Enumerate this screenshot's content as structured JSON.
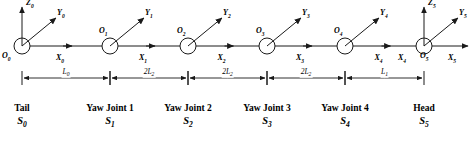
{
  "figure": {
    "line_color": "#1a1a1a",
    "background": "#ffffff"
  },
  "frames": [
    {
      "origin_label": "O",
      "origin_sub": "0",
      "x_label": "X",
      "x_sub": "0",
      "y_label": "Y",
      "y_sub": "0",
      "z_label": "Z",
      "z_sub": "0",
      "has_z": true,
      "cx": 22,
      "cy": 46,
      "caption_name": "Tail",
      "caption_sym": "S",
      "caption_sub": "0",
      "caption_cx": 22
    },
    {
      "origin_label": "O",
      "origin_sub": "1",
      "x_label": "X",
      "x_sub": "1",
      "y_label": "Y",
      "y_sub": "1",
      "z_label": "",
      "z_sub": "",
      "has_z": false,
      "cx": 110,
      "cy": 46,
      "caption_name": "Yaw Joint 1",
      "caption_sym": "S",
      "caption_sub": "1",
      "caption_cx": 110
    },
    {
      "origin_label": "O",
      "origin_sub": "2",
      "x_label": "X",
      "x_sub": "2",
      "y_label": "Y",
      "y_sub": "2",
      "z_label": "",
      "z_sub": "",
      "has_z": false,
      "cx": 188,
      "cy": 46,
      "caption_name": "Yaw Joint 2",
      "caption_sym": "S",
      "caption_sub": "2",
      "caption_cx": 188
    },
    {
      "origin_label": "O",
      "origin_sub": "3",
      "x_label": "X",
      "x_sub": "3",
      "y_label": "Y",
      "y_sub": "3",
      "z_label": "",
      "z_sub": "",
      "has_z": false,
      "cx": 267,
      "cy": 46,
      "caption_name": "Yaw Joint 3",
      "caption_sym": "S",
      "caption_sub": "3",
      "caption_cx": 267
    },
    {
      "origin_label": "O",
      "origin_sub": "4",
      "x_label": "X",
      "x_sub": "4",
      "y_label": "Y",
      "y_sub": "4",
      "z_label": "",
      "z_sub": "",
      "has_z": false,
      "cx": 345,
      "cy": 46,
      "caption_name": "Yaw Joint 4",
      "caption_sym": "S",
      "caption_sub": "4",
      "caption_cx": 345
    },
    {
      "origin_label": "O",
      "origin_sub": "5",
      "x_label": "X",
      "x_sub": "5",
      "y_label": "Y",
      "y_sub": "5",
      "z_label": "Z",
      "z_sub": "5",
      "has_z": true,
      "cx": 424,
      "cy": 46,
      "caption_name": "Head",
      "caption_sym": "S",
      "caption_sub": "5",
      "caption_cx": 424
    }
  ],
  "dimensions": [
    {
      "label": "L",
      "sub": "0",
      "prefix": "",
      "x1": 22,
      "x2": 110,
      "y": 78
    },
    {
      "label": "L",
      "sub": "2",
      "prefix": "2",
      "x1": 110,
      "x2": 188,
      "y": 78
    },
    {
      "label": "L",
      "sub": "2",
      "prefix": "2",
      "x1": 188,
      "x2": 267,
      "y": 78
    },
    {
      "label": "L",
      "sub": "2",
      "prefix": "2",
      "x1": 267,
      "x2": 345,
      "y": 78
    },
    {
      "label": "L",
      "sub": "1",
      "prefix": "",
      "x1": 345,
      "x2": 424,
      "y": 78
    }
  ],
  "icons": {
    "arrowhead": "arrowhead-icon",
    "joint_circle": "joint-circle-icon"
  }
}
